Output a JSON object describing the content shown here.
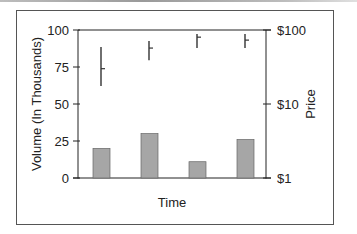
{
  "chart_data": {
    "type": "bar",
    "subtype": "volume-bars-with-high-low-close",
    "title": "",
    "xlabel": "Time",
    "ylabel": "Volume (In Thousands)",
    "y2label": "Price",
    "categories": [
      "1",
      "2",
      "3",
      "4"
    ],
    "ylim": [
      0,
      100
    ],
    "yticks": [
      0,
      25,
      50,
      75,
      100
    ],
    "ytick_labels": [
      "0",
      "25",
      "50",
      "75",
      "100"
    ],
    "y2scale": "log",
    "y2lim": [
      1,
      100
    ],
    "y2ticks": [
      1,
      10,
      100
    ],
    "y2tick_labels": [
      "$1",
      "$10",
      "$100"
    ],
    "grid": false,
    "series": [
      {
        "name": "Volume",
        "kind": "bar",
        "values": [
          20,
          30,
          11,
          26
        ],
        "color": "#a6a6a6"
      },
      {
        "name": "Price",
        "kind": "hlc",
        "axis": "y2",
        "high": [
          59,
          71,
          88,
          88
        ],
        "low": [
          17.5,
          39,
          57,
          57
        ],
        "close": [
          30,
          57,
          80,
          73
        ],
        "color": "#333333"
      }
    ]
  }
}
